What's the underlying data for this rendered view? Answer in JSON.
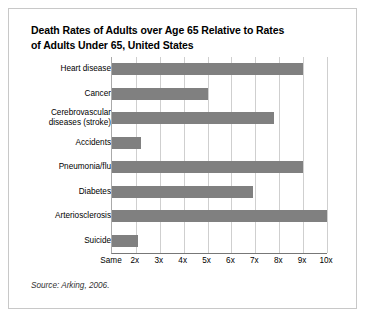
{
  "figure": {
    "title_line1": "Death Rates of Adults over Age 65 Relative to Rates",
    "title_line2": "of Adults Under 65, United States",
    "source": "Source: Arking, 2006.",
    "border_color": "#c8c8c8",
    "bar_color": "#808080",
    "grid_color": "#cfcfcf",
    "axis_color": "#777777"
  },
  "chart_data": {
    "type": "bar",
    "orientation": "horizontal",
    "title": "Death Rates of Adults over Age 65 Relative to Rates of Adults Under 65, United States",
    "xlabel": "",
    "ylabel": "",
    "categories": [
      "Heart disease",
      "Cancer",
      "Cerebrovascular diseases (stroke)",
      "Accidents",
      "Pneumonia/flu",
      "Diabetes",
      "Arteriosclerosis",
      "Suicide"
    ],
    "category_labels": [
      {
        "line1": "Heart disease",
        "line2": ""
      },
      {
        "line1": "Cancer",
        "line2": ""
      },
      {
        "line1": "Cerebrovascular",
        "line2": "diseases (stroke)"
      },
      {
        "line1": "Accidents",
        "line2": ""
      },
      {
        "line1": "Pneumonia/flu",
        "line2": ""
      },
      {
        "line1": "Diabetes",
        "line2": ""
      },
      {
        "line1": "Arteriosclerosis",
        "line2": ""
      },
      {
        "line1": "Suicide",
        "line2": ""
      }
    ],
    "values": [
      9.0,
      5.0,
      7.8,
      2.2,
      9.0,
      6.9,
      10.0,
      2.1
    ],
    "xlim": [
      1,
      10
    ],
    "tick_values": [
      1,
      2,
      3,
      4,
      5,
      6,
      7,
      8,
      9,
      10
    ],
    "tick_labels": [
      "Same",
      "2x",
      "3x",
      "4x",
      "5x",
      "6x",
      "7x",
      "8x",
      "9x",
      "10x"
    ],
    "grid": true,
    "grid_axis": "x",
    "legend": false,
    "annotations": [
      "Source: Arking, 2006."
    ]
  }
}
